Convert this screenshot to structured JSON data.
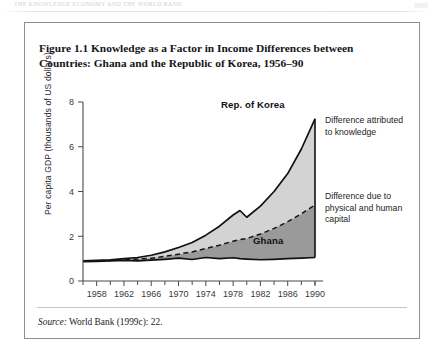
{
  "page": {
    "running_head": "THE KNOWLEDGE ECONOMY AND THE WORLD BANK",
    "corner_mark": ""
  },
  "figure": {
    "title": "Figure 1.1 Knowledge as a Factor in Income Differences between Countries: Ghana and the Republic of Korea, 1956–90",
    "source_label": "Source:",
    "source_text": " World Bank (1999c): 22."
  },
  "annotations": {
    "knowledge": "Difference attributed to knowledge",
    "capital": "Difference due to physical and human capital",
    "korea_label": "Rep. of Korea",
    "ghana_label": "Ghana"
  },
  "colors": {
    "band_knowledge": "#d3d3d3",
    "band_capital": "#9a9a9a",
    "line": "#111115",
    "axis": "#4a4a50",
    "frame": "#8e8e96",
    "page_bg": "#ffffff"
  },
  "chart_data": {
    "type": "area",
    "title": "Figure 1.1 Knowledge as a Factor in Income Differences between Countries: Ghana and the Republic of Korea, 1956–90",
    "xlabel": "",
    "ylabel": "Per capita GDP (thousands of US dollars)",
    "xlim": [
      1956,
      1990
    ],
    "ylim": [
      0,
      8
    ],
    "yticks": [
      0,
      2,
      4,
      6,
      8
    ],
    "xticks": [
      1958,
      1962,
      1966,
      1970,
      1974,
      1978,
      1982,
      1986,
      1990
    ],
    "xticks_minor": [
      1956,
      1960,
      1964,
      1968,
      1972,
      1976,
      1980,
      1984,
      1988,
      1990
    ],
    "grid": false,
    "legend": "inline-labels",
    "x": [
      1956,
      1958,
      1960,
      1962,
      1964,
      1966,
      1968,
      1970,
      1972,
      1974,
      1976,
      1978,
      1979,
      1980,
      1982,
      1984,
      1986,
      1988,
      1990
    ],
    "series": [
      {
        "name": "Rep. of Korea",
        "style": "solid",
        "values": [
          0.9,
          0.92,
          0.95,
          1.0,
          1.05,
          1.15,
          1.3,
          1.5,
          1.72,
          2.05,
          2.45,
          2.95,
          3.15,
          2.85,
          3.35,
          4.0,
          4.8,
          5.9,
          7.25
        ]
      },
      {
        "name": "Difference due to physical and human capital (upper bound of Ghana-plus-capital)",
        "style": "dashed",
        "values": [
          0.88,
          0.9,
          0.92,
          0.95,
          0.98,
          1.02,
          1.1,
          1.2,
          1.3,
          1.45,
          1.6,
          1.78,
          1.85,
          1.9,
          2.1,
          2.35,
          2.65,
          3.0,
          3.4
        ]
      },
      {
        "name": "Ghana",
        "style": "solid",
        "values": [
          0.86,
          0.88,
          0.9,
          0.92,
          0.9,
          0.93,
          0.97,
          1.02,
          0.96,
          1.05,
          1.0,
          1.04,
          1.0,
          0.98,
          0.95,
          0.97,
          1.0,
          1.02,
          1.05
        ]
      }
    ],
    "bands": [
      {
        "name": "Difference attributed to knowledge",
        "between": [
          "Rep. of Korea",
          "dashed"
        ],
        "color": "#d3d3d3"
      },
      {
        "name": "Difference due to physical and human capital",
        "between": [
          "dashed",
          "Ghana"
        ],
        "color": "#9a9a9a"
      }
    ]
  }
}
